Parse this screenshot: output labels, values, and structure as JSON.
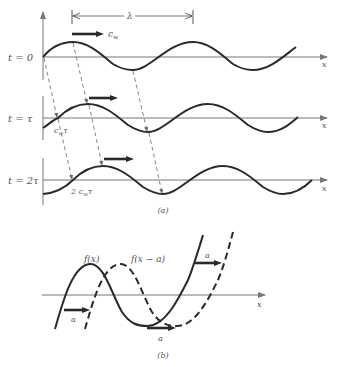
{
  "figure": {
    "panel_a": {
      "caption": "(a)",
      "wavelength_label": "λ",
      "velocity_label": "c",
      "velocity_sub": "w",
      "rows": [
        {
          "time_label": "t = 0",
          "axis_label": "x"
        },
        {
          "time_label": "t = τ",
          "axis_label": "x",
          "shift_label": "c",
          "shift_sub": "w",
          "shift_suffix": "τ"
        },
        {
          "time_label": "t = 2τ",
          "axis_label": "x",
          "shift_label": "2 c",
          "shift_sub": "w",
          "shift_suffix": "τ"
        }
      ]
    },
    "panel_b": {
      "caption": "(b)",
      "curve_solid_label": "f(x)",
      "curve_dashed_label": "f(x − a)",
      "shift_label": "a",
      "axis_label": "x"
    }
  },
  "colors": {
    "ink": "#2a2a2a",
    "axis": "#777777",
    "text": "#555555"
  }
}
